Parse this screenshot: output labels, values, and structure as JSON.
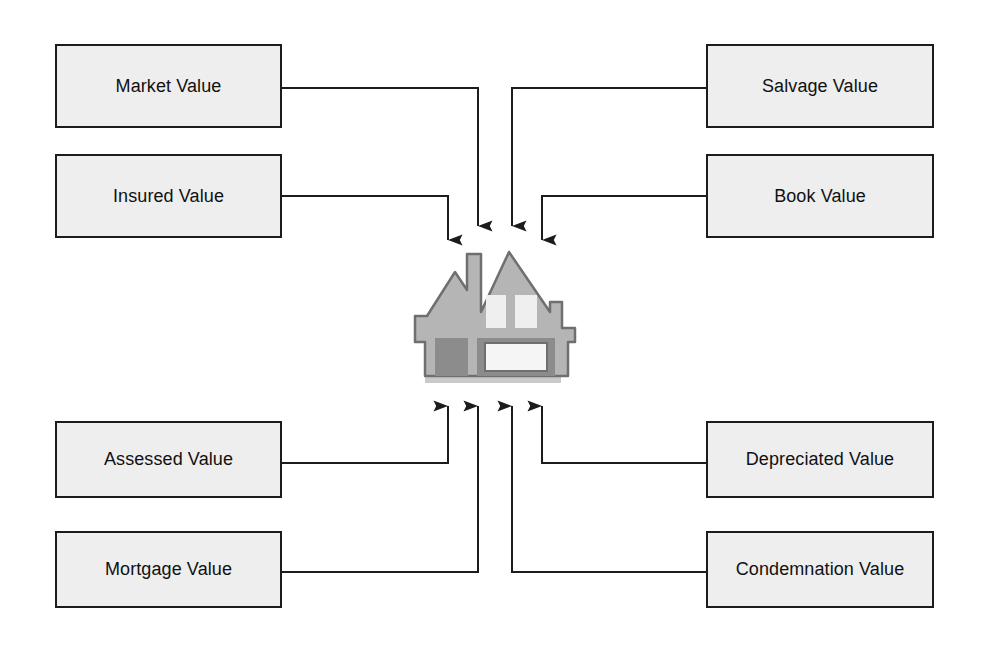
{
  "diagram": {
    "center": {
      "icon": "house-icon",
      "label": "House / Property",
      "body_color": "#b5b5b5",
      "accent_color": "#8c8c8c",
      "window_color": "#efefef",
      "outline_color": "#6f6f6f",
      "shadow_color": "#c9c9c9"
    },
    "style": {
      "box_fill": "#eeeeee",
      "box_border": "#1c1c1c",
      "connector_color": "#1c1c1c",
      "text_color": "#111111",
      "background": "#ffffff"
    },
    "nodes": [
      {
        "id": "market-value",
        "label": "Market Value",
        "side": "left",
        "row": "top",
        "direction": "into-center"
      },
      {
        "id": "insured-value",
        "label": "Insured Value",
        "side": "left",
        "row": "top",
        "direction": "into-center"
      },
      {
        "id": "salvage-value",
        "label": "Salvage Value",
        "side": "right",
        "row": "top",
        "direction": "into-center"
      },
      {
        "id": "book-value",
        "label": "Book Value",
        "side": "right",
        "row": "top",
        "direction": "into-center"
      },
      {
        "id": "assessed-value",
        "label": "Assessed Value",
        "side": "left",
        "row": "bottom",
        "direction": "into-center"
      },
      {
        "id": "mortgage-value",
        "label": "Mortgage Value",
        "side": "left",
        "row": "bottom",
        "direction": "into-center"
      },
      {
        "id": "depreciated-value",
        "label": "Depreciated Value",
        "side": "right",
        "row": "bottom",
        "direction": "into-center"
      },
      {
        "id": "condemnation-value",
        "label": "Condemnation Value",
        "side": "right",
        "row": "bottom",
        "direction": "into-center"
      }
    ],
    "arrow_count": 8
  }
}
